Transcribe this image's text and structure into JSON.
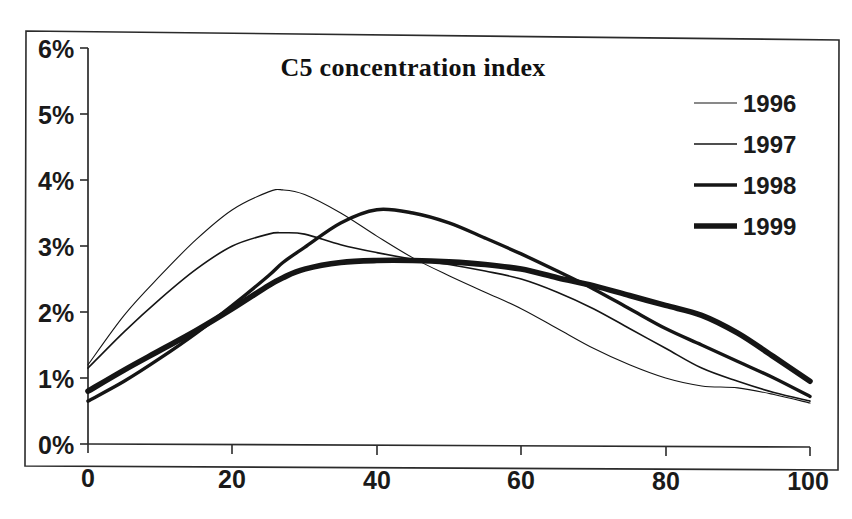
{
  "chart_data": {
    "type": "line",
    "title": "C5 concentration index",
    "xlabel": "",
    "ylabel": "",
    "xlim": [
      0,
      100
    ],
    "ylim": [
      0,
      6
    ],
    "grid": false,
    "legend_position": "top-right",
    "x_tick_labels": [
      "0",
      "20",
      "40",
      "60",
      "80",
      "100"
    ],
    "x_ticks": [
      0,
      20,
      40,
      60,
      80,
      100
    ],
    "y_tick_labels": [
      "0%",
      "1%",
      "2%",
      "3%",
      "4%",
      "5%",
      "6%"
    ],
    "y_ticks": [
      0,
      1,
      2,
      3,
      4,
      5,
      6
    ],
    "y_unit": "%",
    "x": [
      0,
      5,
      10,
      15,
      20,
      25,
      27,
      30,
      35,
      40,
      45,
      50,
      55,
      60,
      65,
      70,
      75,
      80,
      85,
      90,
      95,
      100
    ],
    "series": [
      {
        "name": "1996",
        "line_width": 1.1,
        "values": [
          1.2,
          1.95,
          2.55,
          3.1,
          3.55,
          3.82,
          3.85,
          3.78,
          3.5,
          3.15,
          2.82,
          2.55,
          2.3,
          2.05,
          1.75,
          1.45,
          1.2,
          1.0,
          0.88,
          0.85,
          0.75,
          0.62
        ]
      },
      {
        "name": "1997",
        "line_width": 1.6,
        "values": [
          1.15,
          1.7,
          2.2,
          2.65,
          3.0,
          3.18,
          3.2,
          3.18,
          3.02,
          2.9,
          2.8,
          2.72,
          2.62,
          2.5,
          2.3,
          2.05,
          1.75,
          1.45,
          1.15,
          0.95,
          0.78,
          0.65
        ]
      },
      {
        "name": "1998",
        "line_width": 3.4,
        "values": [
          0.65,
          0.95,
          1.3,
          1.68,
          2.1,
          2.55,
          2.75,
          2.98,
          3.35,
          3.55,
          3.5,
          3.35,
          3.12,
          2.88,
          2.62,
          2.35,
          2.05,
          1.75,
          1.5,
          1.25,
          1.0,
          0.72
        ]
      },
      {
        "name": "1999",
        "line_width": 5.6,
        "values": [
          0.8,
          1.12,
          1.42,
          1.72,
          2.05,
          2.4,
          2.52,
          2.65,
          2.75,
          2.78,
          2.78,
          2.76,
          2.72,
          2.65,
          2.52,
          2.4,
          2.25,
          2.1,
          1.95,
          1.68,
          1.32,
          0.95
        ]
      }
    ]
  },
  "chart": {
    "title": "C5 concentration index",
    "border": "outer-frame"
  },
  "legend": {
    "items": [
      {
        "label": "1996"
      },
      {
        "label": "1997"
      },
      {
        "label": "1998"
      },
      {
        "label": "1999"
      }
    ]
  },
  "axes": {
    "y_labels": [
      "6%",
      "5%",
      "4%",
      "3%",
      "2%",
      "1%",
      "0%"
    ],
    "x_labels": [
      "0",
      "20",
      "40",
      "60",
      "80",
      "100"
    ]
  }
}
